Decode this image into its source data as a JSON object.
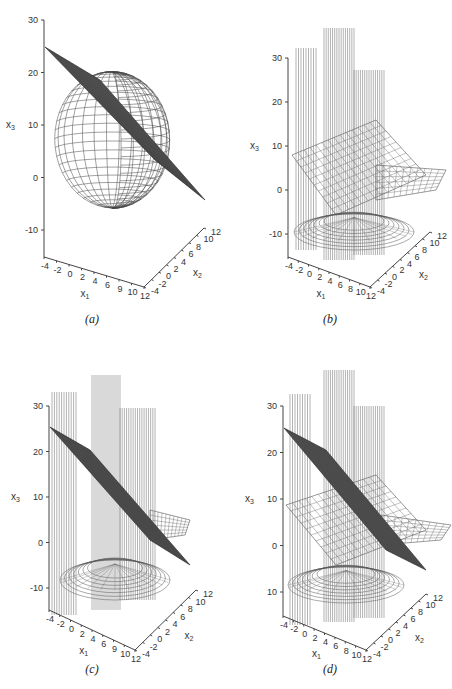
{
  "figure": {
    "panels": [
      {
        "id": "a",
        "caption": "(a)"
      },
      {
        "id": "b",
        "caption": "(b)"
      },
      {
        "id": "c",
        "caption": "(c)"
      },
      {
        "id": "d",
        "caption": "(d)"
      }
    ]
  },
  "chart_data": [
    {
      "type": "surface3d",
      "panel": "(a)",
      "title": "",
      "xlabel": "x1",
      "ylabel": "x2",
      "zlabel": "x3",
      "x_ticks": [
        "-4",
        "-2",
        "0",
        "2",
        "4",
        "6",
        "9",
        "10",
        "12"
      ],
      "y_ticks": [
        "-4",
        "-2",
        "0",
        "2",
        "4",
        "6",
        "8",
        "10",
        "12"
      ],
      "z_ticks": [
        "30",
        "20",
        "10",
        "0",
        "-10"
      ],
      "zlim": [
        -15,
        30
      ],
      "xlim": [
        -4,
        12
      ],
      "ylim": [
        -4,
        12
      ],
      "surfaces": [
        "dark plane (dense mesh) sloping from x3≈25 down to x3≈-5",
        "spherical/cylindrical wireframe surface spanning x3≈-12 to 15"
      ]
    },
    {
      "type": "surface3d",
      "panel": "(b)",
      "title": "",
      "xlabel": "x1",
      "ylabel": "x2",
      "zlabel": "x3",
      "x_ticks": [
        "-4",
        "-2",
        "0",
        "2",
        "4",
        "6",
        "8",
        "10",
        "12"
      ],
      "y_ticks": [
        "-4",
        "-2",
        "0",
        "2",
        "4",
        "6",
        "8",
        "10",
        "12"
      ],
      "z_ticks": [
        "30",
        "20",
        "10",
        "0",
        "-10"
      ],
      "zlim": [
        -15,
        30
      ],
      "xlim": [
        -4,
        12
      ],
      "ylim": [
        -4,
        12
      ],
      "surfaces": [
        "vertical curtain wireframe surfaces rising above 30",
        "light wireframe saddle/sheet near x3≈10",
        "bowl-shaped wireframe near x3≈-10"
      ]
    },
    {
      "type": "surface3d",
      "panel": "(c)",
      "title": "",
      "xlabel": "x1",
      "ylabel": "x2",
      "zlabel": "x3",
      "x_ticks": [
        "-4",
        "-2",
        "0",
        "2",
        "4",
        "6",
        "9",
        "10",
        "12"
      ],
      "y_ticks": [
        "-4",
        "-2",
        "0",
        "2",
        "4",
        "6",
        "8",
        "10",
        "12"
      ],
      "z_ticks": [
        "30",
        "20",
        "10",
        "0",
        "-10"
      ],
      "zlim": [
        -15,
        30
      ],
      "xlim": [
        -4,
        12
      ],
      "ylim": [
        -4,
        12
      ],
      "surfaces": [
        "vertical curtain wireframe surfaces",
        "dark sloping plane from x3≈25 to x3≈-5",
        "light wireframe sheet near x3≈5",
        "bowl wireframe near bottom"
      ]
    },
    {
      "type": "surface3d",
      "panel": "(d)",
      "title": "",
      "xlabel": "x1",
      "ylabel": "x2",
      "zlabel": "x3",
      "x_ticks": [
        "-4",
        "-2",
        "0",
        "2",
        "4",
        "6",
        "8",
        "10",
        "12"
      ],
      "y_ticks": [
        "-4",
        "-2",
        "0",
        "2",
        "4",
        "6",
        "8",
        "10",
        "12"
      ],
      "z_ticks": [
        "30",
        "20",
        "10",
        "0",
        "10"
      ],
      "zlim": [
        -15,
        30
      ],
      "xlim": [
        -4,
        12
      ],
      "ylim": [
        -4,
        12
      ],
      "surfaces": [
        "vertical curtain wireframe surfaces",
        "dark sloping plane",
        "light wireframe sheet near x3≈10",
        "bowl wireframe near x3≈-10"
      ]
    }
  ]
}
